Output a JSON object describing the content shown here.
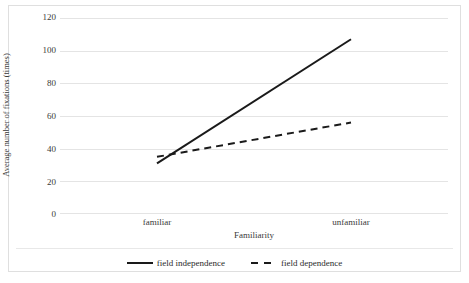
{
  "chart_data": {
    "type": "line",
    "title": "",
    "xlabel": "Familiarity",
    "ylabel": "Average number of fixations (times)",
    "categories": [
      "familiar",
      "unfamiliar"
    ],
    "yticks": [
      120,
      100,
      80,
      60,
      40,
      20,
      0
    ],
    "ylim": [
      0,
      120
    ],
    "grid": true,
    "legend_position": "bottom-center",
    "series": [
      {
        "name": "field independence",
        "style": "solid",
        "color": "#1a1a1a",
        "values": [
          31,
          107
        ]
      },
      {
        "name": "field dependence",
        "style": "dashed",
        "color": "#1a1a1a",
        "values": [
          35,
          56
        ]
      }
    ]
  },
  "axis": {
    "y_title": "Average number of fixations (times)",
    "x_title": "Familiarity",
    "y_tick_labels": [
      "120",
      "100",
      "80",
      "60",
      "40",
      "20",
      "0"
    ],
    "x_tick_labels": [
      "familiar",
      "unfamiliar"
    ]
  },
  "legend": {
    "items": [
      {
        "label": "field independence",
        "style": "solid"
      },
      {
        "label": "field dependence",
        "style": "dashed"
      }
    ]
  },
  "colors": {
    "line": "#1a1a1a",
    "grid": "#e4e4e4",
    "frame": "#dfdfdf",
    "text": "#3a3a3a",
    "background": "#ffffff"
  }
}
